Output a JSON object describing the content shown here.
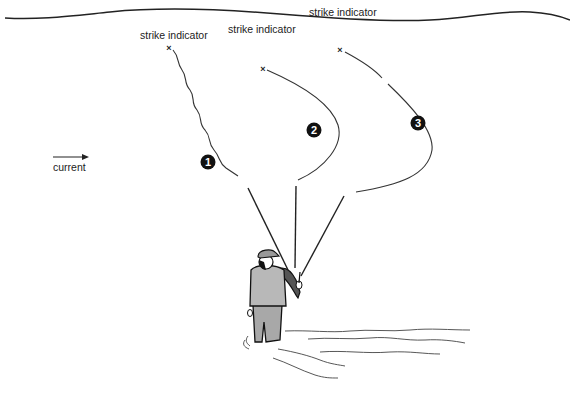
{
  "diagram": {
    "current_label": "current",
    "indicators": [
      {
        "label": "strike indicator",
        "marker": "×",
        "number": "1"
      },
      {
        "label": "strike indicator",
        "marker": "×",
        "number": "2"
      },
      {
        "label": "strike indicator",
        "marker": "×",
        "number": "3"
      }
    ],
    "colors": {
      "ink": "#222222",
      "vest": "#b8b8b8",
      "jacket": "#555555",
      "waders": "#a8a8a8",
      "background": "#ffffff"
    }
  }
}
